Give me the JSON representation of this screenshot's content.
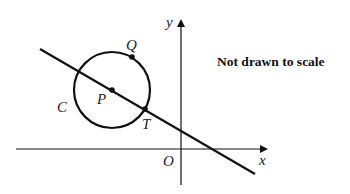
{
  "diagram": {
    "note": "Not drawn to scale",
    "labels": {
      "y_axis": "y",
      "x_axis": "x",
      "origin": "O",
      "point_q": "Q",
      "point_p": "P",
      "point_t": "T",
      "circle": "C"
    },
    "colors": {
      "stroke": "#111111",
      "background": "#ffffff"
    },
    "geometry": {
      "circle_center": [
        112,
        90
      ],
      "circle_radius": 38,
      "line_start": [
        40,
        49
      ],
      "line_end": [
        255,
        174
      ],
      "x_axis_y": 149,
      "y_axis_x": 181,
      "point_q": [
        132,
        57
      ],
      "point_p": [
        112,
        90
      ],
      "point_t": [
        145,
        109
      ]
    }
  }
}
